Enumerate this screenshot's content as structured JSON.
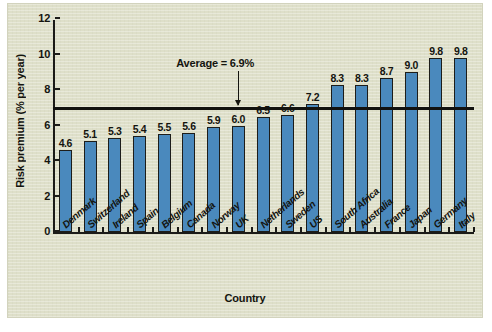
{
  "chart_data": {
    "type": "bar",
    "title": "",
    "xlabel": "Country",
    "ylabel": "Risk premium (% per year)",
    "categories": [
      "Denmark",
      "Switzerland",
      "Ireland",
      "Spain",
      "Belgium",
      "Canada",
      "Norway",
      "UK",
      "Netherlands",
      "Sweden",
      "US",
      "South Africa",
      "Australia",
      "France",
      "Japan",
      "Germany",
      "Italy"
    ],
    "values": [
      4.6,
      5.1,
      5.3,
      5.4,
      5.5,
      5.6,
      5.9,
      6.0,
      6.5,
      6.6,
      7.2,
      8.3,
      8.3,
      8.7,
      9.0,
      9.8,
      9.8
    ],
    "value_labels": [
      "4.6",
      "5.1",
      "5.3",
      "5.4",
      "5.5",
      "5.6",
      "5.9",
      "6.0",
      "6.5",
      "6.6",
      "7.2",
      "8.3",
      "8.3",
      "8.7",
      "9.0",
      "9.8",
      "9.8"
    ],
    "ylim": [
      0,
      12
    ],
    "yticks": [
      0,
      2,
      4,
      6,
      8,
      10,
      12
    ],
    "ytick_labels": [
      "0",
      "2",
      "4",
      "6",
      "8",
      "10",
      "12"
    ],
    "grid": false,
    "legend": "none",
    "bar_color": "#4a89bd",
    "bar_edge_color": "#1d1d1a",
    "background_color": "#dedfc9",
    "axis_color": "#1b1b18",
    "annotations": [
      {
        "name": "average-line",
        "label": "Average = 6.9%",
        "value": 6.9,
        "style": "horizontal-line-with-arrow",
        "color": "#121210"
      }
    ]
  }
}
